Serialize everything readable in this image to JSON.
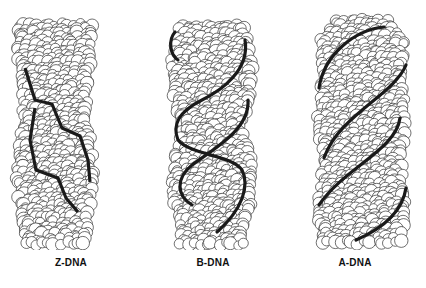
{
  "figure": {
    "panels": [
      {
        "id": "z-dna",
        "label": "Z-DNA",
        "helix": "left-handed zigzag backbone"
      },
      {
        "id": "b-dna",
        "label": "B-DNA",
        "helix": "right-handed, wide major groove"
      },
      {
        "id": "a-dna",
        "label": "A-DNA",
        "helix": "right-handed, compact, tilted"
      }
    ],
    "colors": {
      "atom_fill": "#ffffff",
      "atom_stroke": "#333333",
      "backbone": "#1a1a1a",
      "background": "#ffffff"
    }
  }
}
